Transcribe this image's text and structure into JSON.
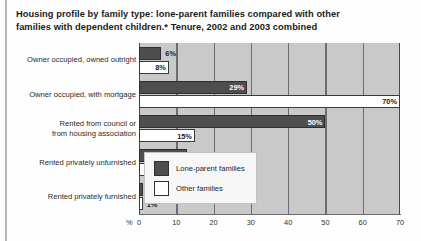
{
  "title": {
    "line1": "Housing profile by family type: lone-parent families compared with other",
    "line2": "families with dependent children.* Tenure, 2002 and 2003 combined"
  },
  "chart_data": {
    "type": "bar",
    "orientation": "horizontal",
    "title": "Housing profile by family type: lone-parent families compared with other families with dependent children.* Tenure, 2002 and 2003 combined",
    "xlabel": "%",
    "ylabel": "",
    "xlim": [
      0,
      70
    ],
    "xticks": [
      0,
      10,
      20,
      30,
      40,
      50,
      60,
      70
    ],
    "xtick_labels": [
      "0",
      "10",
      "20",
      "30",
      "40",
      "50",
      "60",
      "70"
    ],
    "grid": true,
    "legend_position": "bottom-right",
    "categories": [
      "Owner occupied, owned outright",
      "Owner occupied, with mortgage",
      "Rented from council or from housing association",
      "Rented privately unfurnished",
      "Rented privately furnished"
    ],
    "series": [
      {
        "name": "Lone-parent families",
        "color": "#4e4e4e",
        "values": [
          6,
          29,
          50,
          13,
          1
        ],
        "labels": [
          "6%",
          "29%",
          "50%",
          "13%",
          "1%"
        ]
      },
      {
        "name": "Other families",
        "color": "#ffffff",
        "values": [
          8,
          70,
          15,
          6,
          1
        ],
        "labels": [
          "8%",
          "70%",
          "15%",
          "6%",
          "1%"
        ]
      }
    ]
  },
  "axis": {
    "percent_symbol": "%",
    "ticks": [
      "0",
      "10",
      "20",
      "30",
      "40",
      "50",
      "60",
      "70"
    ]
  },
  "categories": [
    {
      "line1": "Owner occupied, owned outright",
      "line2": ""
    },
    {
      "line1": "Owner occupied, with mortgage",
      "line2": ""
    },
    {
      "line1": "Rented from council or",
      "line2": "from housing association"
    },
    {
      "line1": "Rented privately unfurnished",
      "line2": ""
    },
    {
      "line1": "Rented privately furnished",
      "line2": ""
    }
  ],
  "bars": [
    {
      "dark_label": "6%",
      "light_label": "8%"
    },
    {
      "dark_label": "29%",
      "light_label": "70%"
    },
    {
      "dark_label": "50%",
      "light_label": "15%"
    },
    {
      "dark_label": "13%",
      "light_label": "6%"
    },
    {
      "dark_label": "1%",
      "light_label": "1%"
    }
  ],
  "legend": {
    "items": [
      {
        "label": "Lone-parent families"
      },
      {
        "label": "Other families"
      }
    ]
  }
}
